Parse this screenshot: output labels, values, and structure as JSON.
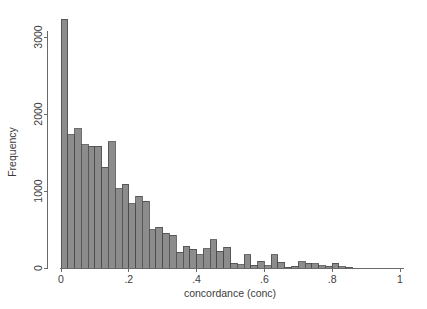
{
  "chart_data": {
    "type": "bar",
    "title": "",
    "subtitle": "",
    "xlabel": "concordance (conc)",
    "ylabel": "Frequency",
    "xlim": [
      0,
      1
    ],
    "ylim": [
      0,
      3350
    ],
    "grid": false,
    "legend": null,
    "bar_fill_color": "#8c8c8c",
    "bar_edge_color": "#4a4a4a",
    "axis_color": "#6a6a6a",
    "text_color": "#3b3b3b",
    "background_color": "#ffffff",
    "bin_width": 0.02,
    "xticks": [
      {
        "value": 0,
        "label": "0"
      },
      {
        "value": 0.2,
        "label": ".2"
      },
      {
        "value": 0.4,
        "label": ".4"
      },
      {
        "value": 0.6,
        "label": ".6"
      },
      {
        "value": 0.8,
        "label": ".8"
      },
      {
        "value": 1,
        "label": "1"
      }
    ],
    "yticks": [
      {
        "value": 0,
        "label": "0"
      },
      {
        "value": 1000,
        "label": "1000"
      },
      {
        "value": 2000,
        "label": "2000"
      },
      {
        "value": 3000,
        "label": "3000"
      }
    ],
    "bins": [
      {
        "x0": 0.0,
        "x1": 0.02,
        "value": 3230
      },
      {
        "x0": 0.02,
        "x1": 0.04,
        "value": 1730
      },
      {
        "x0": 0.04,
        "x1": 0.06,
        "value": 1810
      },
      {
        "x0": 0.06,
        "x1": 0.08,
        "value": 1600
      },
      {
        "x0": 0.08,
        "x1": 0.1,
        "value": 1580
      },
      {
        "x0": 0.1,
        "x1": 0.12,
        "value": 1580
      },
      {
        "x0": 0.12,
        "x1": 0.14,
        "value": 1310
      },
      {
        "x0": 0.14,
        "x1": 0.16,
        "value": 1640
      },
      {
        "x0": 0.16,
        "x1": 0.18,
        "value": 1030
      },
      {
        "x0": 0.18,
        "x1": 0.2,
        "value": 1090
      },
      {
        "x0": 0.2,
        "x1": 0.22,
        "value": 835
      },
      {
        "x0": 0.22,
        "x1": 0.24,
        "value": 930
      },
      {
        "x0": 0.24,
        "x1": 0.26,
        "value": 865
      },
      {
        "x0": 0.26,
        "x1": 0.28,
        "value": 500
      },
      {
        "x0": 0.28,
        "x1": 0.3,
        "value": 530
      },
      {
        "x0": 0.3,
        "x1": 0.32,
        "value": 450
      },
      {
        "x0": 0.32,
        "x1": 0.34,
        "value": 425
      },
      {
        "x0": 0.34,
        "x1": 0.36,
        "value": 205
      },
      {
        "x0": 0.36,
        "x1": 0.38,
        "value": 280
      },
      {
        "x0": 0.38,
        "x1": 0.4,
        "value": 245
      },
      {
        "x0": 0.4,
        "x1": 0.42,
        "value": 175
      },
      {
        "x0": 0.42,
        "x1": 0.44,
        "value": 250
      },
      {
        "x0": 0.44,
        "x1": 0.46,
        "value": 365
      },
      {
        "x0": 0.46,
        "x1": 0.48,
        "value": 215
      },
      {
        "x0": 0.48,
        "x1": 0.5,
        "value": 270
      },
      {
        "x0": 0.5,
        "x1": 0.52,
        "value": 60
      },
      {
        "x0": 0.52,
        "x1": 0.54,
        "value": 45
      },
      {
        "x0": 0.54,
        "x1": 0.56,
        "value": 175
      },
      {
        "x0": 0.56,
        "x1": 0.58,
        "value": 35
      },
      {
        "x0": 0.58,
        "x1": 0.6,
        "value": 85
      },
      {
        "x0": 0.6,
        "x1": 0.62,
        "value": 30
      },
      {
        "x0": 0.62,
        "x1": 0.64,
        "value": 170
      },
      {
        "x0": 0.64,
        "x1": 0.66,
        "value": 75
      },
      {
        "x0": 0.66,
        "x1": 0.68,
        "value": 10
      },
      {
        "x0": 0.68,
        "x1": 0.7,
        "value": 20
      },
      {
        "x0": 0.7,
        "x1": 0.72,
        "value": 80
      },
      {
        "x0": 0.72,
        "x1": 0.74,
        "value": 65
      },
      {
        "x0": 0.74,
        "x1": 0.76,
        "value": 55
      },
      {
        "x0": 0.76,
        "x1": 0.78,
        "value": 30
      },
      {
        "x0": 0.78,
        "x1": 0.8,
        "value": 25
      },
      {
        "x0": 0.8,
        "x1": 0.82,
        "value": 60
      },
      {
        "x0": 0.82,
        "x1": 0.84,
        "value": 15
      },
      {
        "x0": 0.84,
        "x1": 0.86,
        "value": 10
      }
    ]
  }
}
